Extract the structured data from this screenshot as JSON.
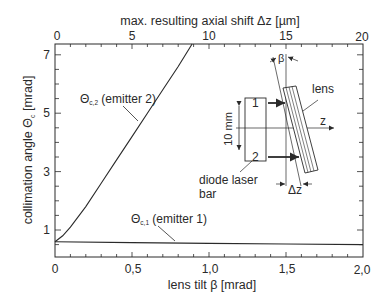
{
  "chart_data": {
    "type": "line",
    "title": "",
    "xlabel": "lens tilt β [mrad]",
    "x2label": "max. resulting axial shift Δz [µm]",
    "ylabel": "collimation angle Θc [mrad]",
    "xlim": [
      0,
      2.0
    ],
    "x2lim": [
      0,
      20
    ],
    "ylim": [
      0.1,
      7.4
    ],
    "grid": false,
    "x_ticks": [
      "0",
      "0,5",
      "1,0",
      "1,5",
      "2,0"
    ],
    "x2_ticks": [
      "0",
      "5",
      "10",
      "15",
      "20"
    ],
    "y_ticks": [
      "1",
      "3",
      "5",
      "7"
    ],
    "series": [
      {
        "name": "Θc,2 (emitter 2)",
        "x": [
          0,
          0.05,
          0.1,
          0.2,
          0.3,
          0.4,
          0.5,
          0.6,
          0.7,
          0.8,
          0.89
        ],
        "y": [
          0.6,
          0.8,
          1.1,
          1.8,
          2.6,
          3.4,
          4.2,
          5.0,
          5.8,
          6.6,
          7.4
        ]
      },
      {
        "name": "Θc,1 (emitter 1)",
        "x": [
          0,
          0.5,
          1.0,
          1.5,
          2.0
        ],
        "y": [
          0.6,
          0.57,
          0.54,
          0.52,
          0.5
        ]
      }
    ],
    "annotations": [
      "Θc,2 (emitter 2)",
      "Θc,1 (emitter 1)"
    ],
    "inset_diagram": {
      "labels": [
        "lens",
        "z",
        "β",
        "Δz",
        "10 mm",
        "1",
        "2",
        "diode laser",
        "bar"
      ]
    }
  },
  "labels": {
    "top_axis_title": "max. resulting axial shift Δz [µm]",
    "bottom_axis_title": "lens tilt β [mrad]",
    "y_axis_title_main": "collimation angle Θ",
    "y_axis_title_sub": "c",
    "y_axis_title_unit": " [mrad]",
    "series2_main": "Θ",
    "series2_sub": "c,2",
    "series2_rest": " (emitter 2)",
    "series1_main": "Θ",
    "series1_sub": "c,1",
    "series1_rest": " (emitter 1)",
    "diagram": {
      "lens": "lens",
      "z": "z",
      "beta": "β",
      "delta_z": "Δz",
      "ten_mm": "10 mm",
      "emitter1": "1",
      "emitter2": "2",
      "bar_line1": "diode laser",
      "bar_line2": "bar"
    }
  },
  "colors": {
    "ink": "#2a2a2a",
    "background": "#ffffff"
  }
}
